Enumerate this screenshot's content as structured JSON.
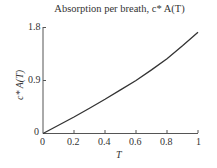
{
  "chart_data": {
    "type": "line",
    "title": "Absorption per breath, c* A(T)",
    "xlabel": "T",
    "ylabel": "c* A(T)",
    "xlim": [
      0,
      1
    ],
    "ylim": [
      0,
      1.8
    ],
    "x_ticks": [
      "0",
      "0.2",
      "0.4",
      "0.6",
      "0.8",
      "1"
    ],
    "y_ticks": [
      "0",
      "0.9",
      "1.8"
    ],
    "grid": false,
    "series": [
      {
        "name": "c* A(T)",
        "color": "#333333",
        "x": [
          0,
          0.1,
          0.2,
          0.3,
          0.4,
          0.5,
          0.6,
          0.7,
          0.8,
          0.9,
          1.0
        ],
        "y": [
          0,
          0.14,
          0.28,
          0.43,
          0.58,
          0.74,
          0.9,
          1.08,
          1.27,
          1.49,
          1.72
        ]
      }
    ]
  },
  "labels": {
    "title": "Absorption per breath, c* A(T)",
    "xlabel": "T",
    "ylabel": "c* A(T)",
    "x0": "0",
    "x1": "0.2",
    "x2": "0.4",
    "x3": "0.6",
    "x4": "0.8",
    "x5": "1",
    "y0": "0",
    "y1": "0.9",
    "y2": "1.8"
  }
}
